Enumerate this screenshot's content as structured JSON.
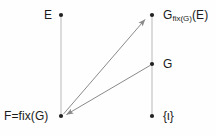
{
  "diagram": {
    "background_color": "#fefefe",
    "text_color": "#1b1b1b",
    "lattice_line_color": "#c8c8c8",
    "arrow_color": "#8a8a8a",
    "dot_color": "#222222",
    "nodes": [
      {
        "id": "E",
        "label": "E",
        "x": 61,
        "y": 15
      },
      {
        "id": "F",
        "label": "F=fix(G)",
        "x": 61,
        "y": 116
      },
      {
        "id": "GfixGE",
        "label": "G",
        "sub": "fix(G)",
        "suffix": "(E)",
        "x": 152,
        "y": 15
      },
      {
        "id": "G",
        "label": "G",
        "x": 152,
        "y": 64
      },
      {
        "id": "unit",
        "label": "{ι}",
        "x": 152,
        "y": 116
      }
    ],
    "lattice_edges": [
      {
        "from": "E",
        "to": "F"
      },
      {
        "from": "GfixGE",
        "to": "unit"
      }
    ],
    "arrows": [
      {
        "from": "F",
        "to": "GfixGE",
        "direction": "up-right"
      },
      {
        "from": "G",
        "to": "F",
        "direction": "down-left"
      }
    ]
  }
}
